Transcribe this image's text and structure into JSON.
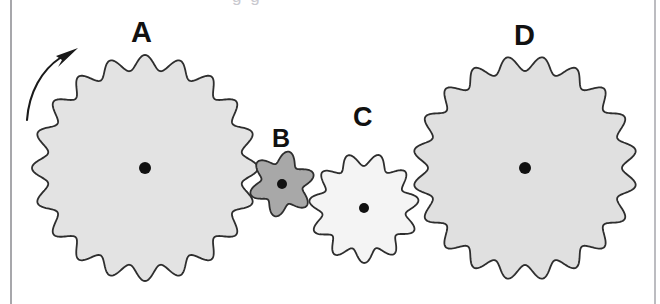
{
  "figure": {
    "kind": "gear-train-diagram",
    "width": 660,
    "height": 304,
    "background_color": "#ffffff",
    "top_bleed_text": "g g",
    "rules": [
      {
        "name": "left-margin-rule",
        "x": 10,
        "color": "#a7a7ab"
      },
      {
        "name": "right-margin-rule",
        "x": 654,
        "color": "#bcbcc0"
      }
    ]
  },
  "labels": {
    "a": "A",
    "b": "B",
    "c": "C",
    "d": "D"
  },
  "rotation_arrow": {
    "name": "counterclockwise-arrow",
    "description": "curved arrow at upper left of gear A indicating direction of rotation",
    "direction": "clockwise",
    "stroke_color": "#1a1a1a"
  },
  "chart_data": {
    "type": "diagram",
    "title": "",
    "gears": [
      {
        "label": "A",
        "cx": 145,
        "cy": 168,
        "outer_radius": 113,
        "root_radius": 98,
        "teeth": 20,
        "fill": "#e3e3e3",
        "stroke": "#2e2e2e",
        "hub_radius": 6,
        "phase_deg": 0
      },
      {
        "label": "B",
        "cx": 282,
        "cy": 184,
        "outer_radius": 33,
        "root_radius": 21,
        "teeth": 6,
        "fill": "#a8a8a8",
        "stroke": "#2e2e2e",
        "hub_radius": 5,
        "phase_deg": 12
      },
      {
        "label": "C",
        "cx": 364,
        "cy": 208,
        "outer_radius": 55,
        "root_radius": 42,
        "teeth": 11,
        "fill": "#f4f4f4",
        "stroke": "#2e2e2e",
        "hub_radius": 5,
        "phase_deg": 16
      },
      {
        "label": "D",
        "cx": 525,
        "cy": 168,
        "outer_radius": 112,
        "root_radius": 97,
        "teeth": 20,
        "fill": "#e0e0e0",
        "stroke": "#2e2e2e",
        "hub_radius": 6,
        "phase_deg": 9
      }
    ]
  }
}
